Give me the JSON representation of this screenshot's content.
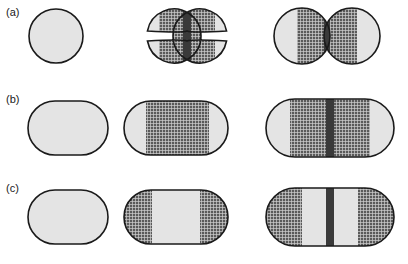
{
  "figure": {
    "background_color": "#ffffff",
    "light_fill_color": "#e4e4e4",
    "hatch_base_color": "#5a5a5a",
    "hatch_line_color": "#d8d8d8",
    "septum_color": "#3a3a3a",
    "outline_color": "#1a1a1a",
    "width": 408,
    "height": 264
  },
  "rows": [
    {
      "label": "(a)",
      "label_x": 6,
      "label_y": 16,
      "shape_type": "circle",
      "description": "coccus cell division sequence",
      "stages": [
        {
          "name": "stage-a1",
          "cx": 56,
          "cy": 36,
          "r": 27,
          "fill": "light",
          "hatched_bands": [],
          "septum_bands": []
        },
        {
          "name": "stage-a2",
          "cx": 187,
          "cy": 36,
          "r": 27,
          "separation": 26,
          "waist": 10,
          "fill": "light",
          "hatched_bands": [
            [
              -28,
              -4
            ],
            [
              4,
              28
            ]
          ],
          "septum_bands": [
            [
              -4,
              4
            ]
          ]
        },
        {
          "name": "stage-a3",
          "cx": 327,
          "cy": 36,
          "r": 28,
          "separation": 50,
          "waist": 3,
          "fill": "light",
          "hatched_bands": [
            [
              -30,
              -3
            ],
            [
              3,
              30
            ]
          ],
          "septum_bands": [
            [
              -3,
              3
            ]
          ]
        }
      ]
    },
    {
      "label": "(b)",
      "label_x": 6,
      "label_y": 103,
      "shape_type": "stadium",
      "description": "rod cell with medial hatched zone expanding",
      "stages": [
        {
          "name": "stage-b1",
          "x": 28,
          "y": 101,
          "width": 80,
          "height": 54,
          "fill": "light",
          "hatched_bands": [],
          "septum_bands": []
        },
        {
          "name": "stage-b2",
          "x": 124,
          "y": 101,
          "width": 104,
          "height": 54,
          "fill": "light",
          "hatched_bands": [
            [
              22,
              85
            ]
          ],
          "septum_bands": []
        },
        {
          "name": "stage-b3",
          "x": 266,
          "y": 99,
          "width": 128,
          "height": 58,
          "fill": "light",
          "hatched_bands": [
            [
              24,
              104
            ]
          ],
          "septum_bands": [
            [
              60,
              68
            ]
          ]
        }
      ]
    },
    {
      "label": "(c)",
      "label_x": 6,
      "label_y": 192,
      "shape_type": "stadium",
      "description": "rod cell with polar hatched zones expanding",
      "stages": [
        {
          "name": "stage-c1",
          "x": 28,
          "y": 190,
          "width": 80,
          "height": 54,
          "fill": "light",
          "hatched_bands": [],
          "septum_bands": []
        },
        {
          "name": "stage-c2",
          "x": 124,
          "y": 190,
          "width": 104,
          "height": 54,
          "fill": "light",
          "hatched_bands": [
            [
              0,
              28
            ],
            [
              76,
              104
            ]
          ],
          "septum_bands": []
        },
        {
          "name": "stage-c3",
          "x": 266,
          "y": 188,
          "width": 128,
          "height": 58,
          "fill": "light",
          "hatched_bands": [
            [
              0,
              36
            ],
            [
              92,
              128
            ]
          ],
          "septum_bands": [
            [
              60,
              68
            ]
          ]
        }
      ]
    }
  ]
}
